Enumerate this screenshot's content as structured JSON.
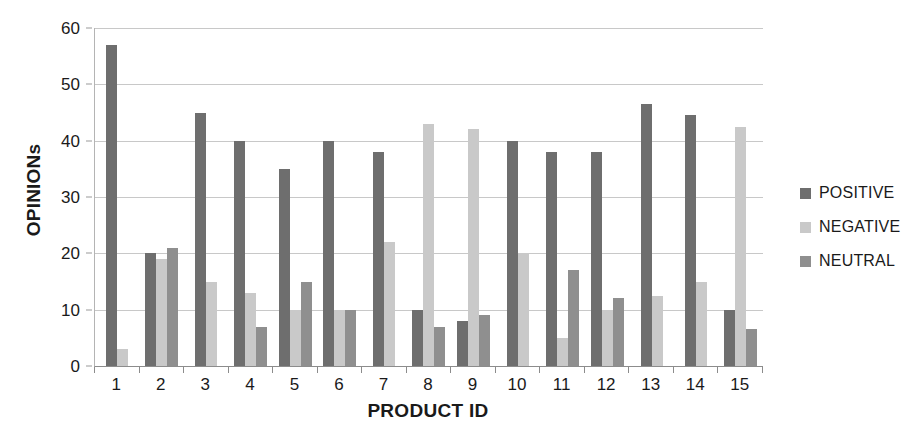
{
  "chart_data": {
    "type": "bar",
    "title": "",
    "xlabel": "PRODUCT ID",
    "ylabel": "OPINIONs",
    "ylim": [
      0,
      60
    ],
    "ytick_step": 10,
    "yticks": [
      0,
      10,
      20,
      30,
      40,
      50,
      60
    ],
    "grid": "horizontal",
    "legend_position": "right",
    "categories": [
      "1",
      "2",
      "3",
      "4",
      "5",
      "6",
      "7",
      "8",
      "9",
      "10",
      "11",
      "12",
      "13",
      "14",
      "15"
    ],
    "series": [
      {
        "name": "POSITIVE",
        "color": "#6e6e6e",
        "values": [
          57,
          20,
          45,
          40,
          35,
          40,
          38,
          10,
          8,
          40,
          38,
          38,
          46.5,
          44.5,
          10
        ]
      },
      {
        "name": "NEGATIVE",
        "color": "#c9c9c9",
        "values": [
          3,
          19,
          15,
          13,
          10,
          10,
          22,
          43,
          42,
          20,
          5,
          10,
          12.5,
          15,
          42.5
        ]
      },
      {
        "name": "NEUTRAL",
        "color": "#8f8f8f",
        "values": [
          null,
          21,
          null,
          7,
          15,
          10,
          null,
          7,
          9,
          null,
          17,
          12,
          null,
          null,
          6.5
        ]
      }
    ]
  },
  "legend": {
    "items": [
      {
        "label": "POSITIVE",
        "color": "#6e6e6e"
      },
      {
        "label": "NEGATIVE",
        "color": "#c9c9c9"
      },
      {
        "label": "NEUTRAL",
        "color": "#8f8f8f"
      }
    ]
  },
  "axes": {
    "y_title": "OPINIONs",
    "x_title": "PRODUCT ID"
  }
}
